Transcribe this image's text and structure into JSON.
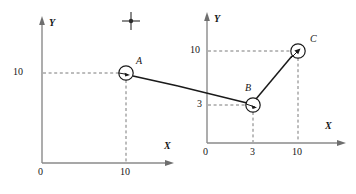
{
  "figure": {
    "type": "diagram",
    "background_color": "#ffffff",
    "stroke_color": "#1a1a1a",
    "axis_color": "#8a8a8a",
    "dash_color": "#7a7a7a"
  },
  "left_plot": {
    "axis_y_label": "Y",
    "axis_x_label": "X",
    "origin_label": "0",
    "y_ticks": [
      {
        "label": "10",
        "value": 10
      }
    ],
    "x_ticks": [
      {
        "label": "10",
        "value": 10
      }
    ],
    "points": [
      {
        "name": "A",
        "label": "A",
        "x": 10,
        "y": 10
      }
    ],
    "markers": [
      {
        "name": "cross-marker",
        "label": ""
      }
    ]
  },
  "right_plot": {
    "axis_y_label": "Y",
    "axis_x_label": "X",
    "origin_label": "0",
    "y_ticks": [
      {
        "label": "10",
        "value": 10
      },
      {
        "label": "3",
        "value": 3
      }
    ],
    "x_ticks": [
      {
        "label": "3",
        "value": 3
      },
      {
        "label": "10",
        "value": 10
      }
    ],
    "points": [
      {
        "name": "B",
        "label": "B",
        "x": 3,
        "y": 3
      },
      {
        "name": "C",
        "label": "C",
        "x": 10,
        "y": 10
      }
    ]
  }
}
